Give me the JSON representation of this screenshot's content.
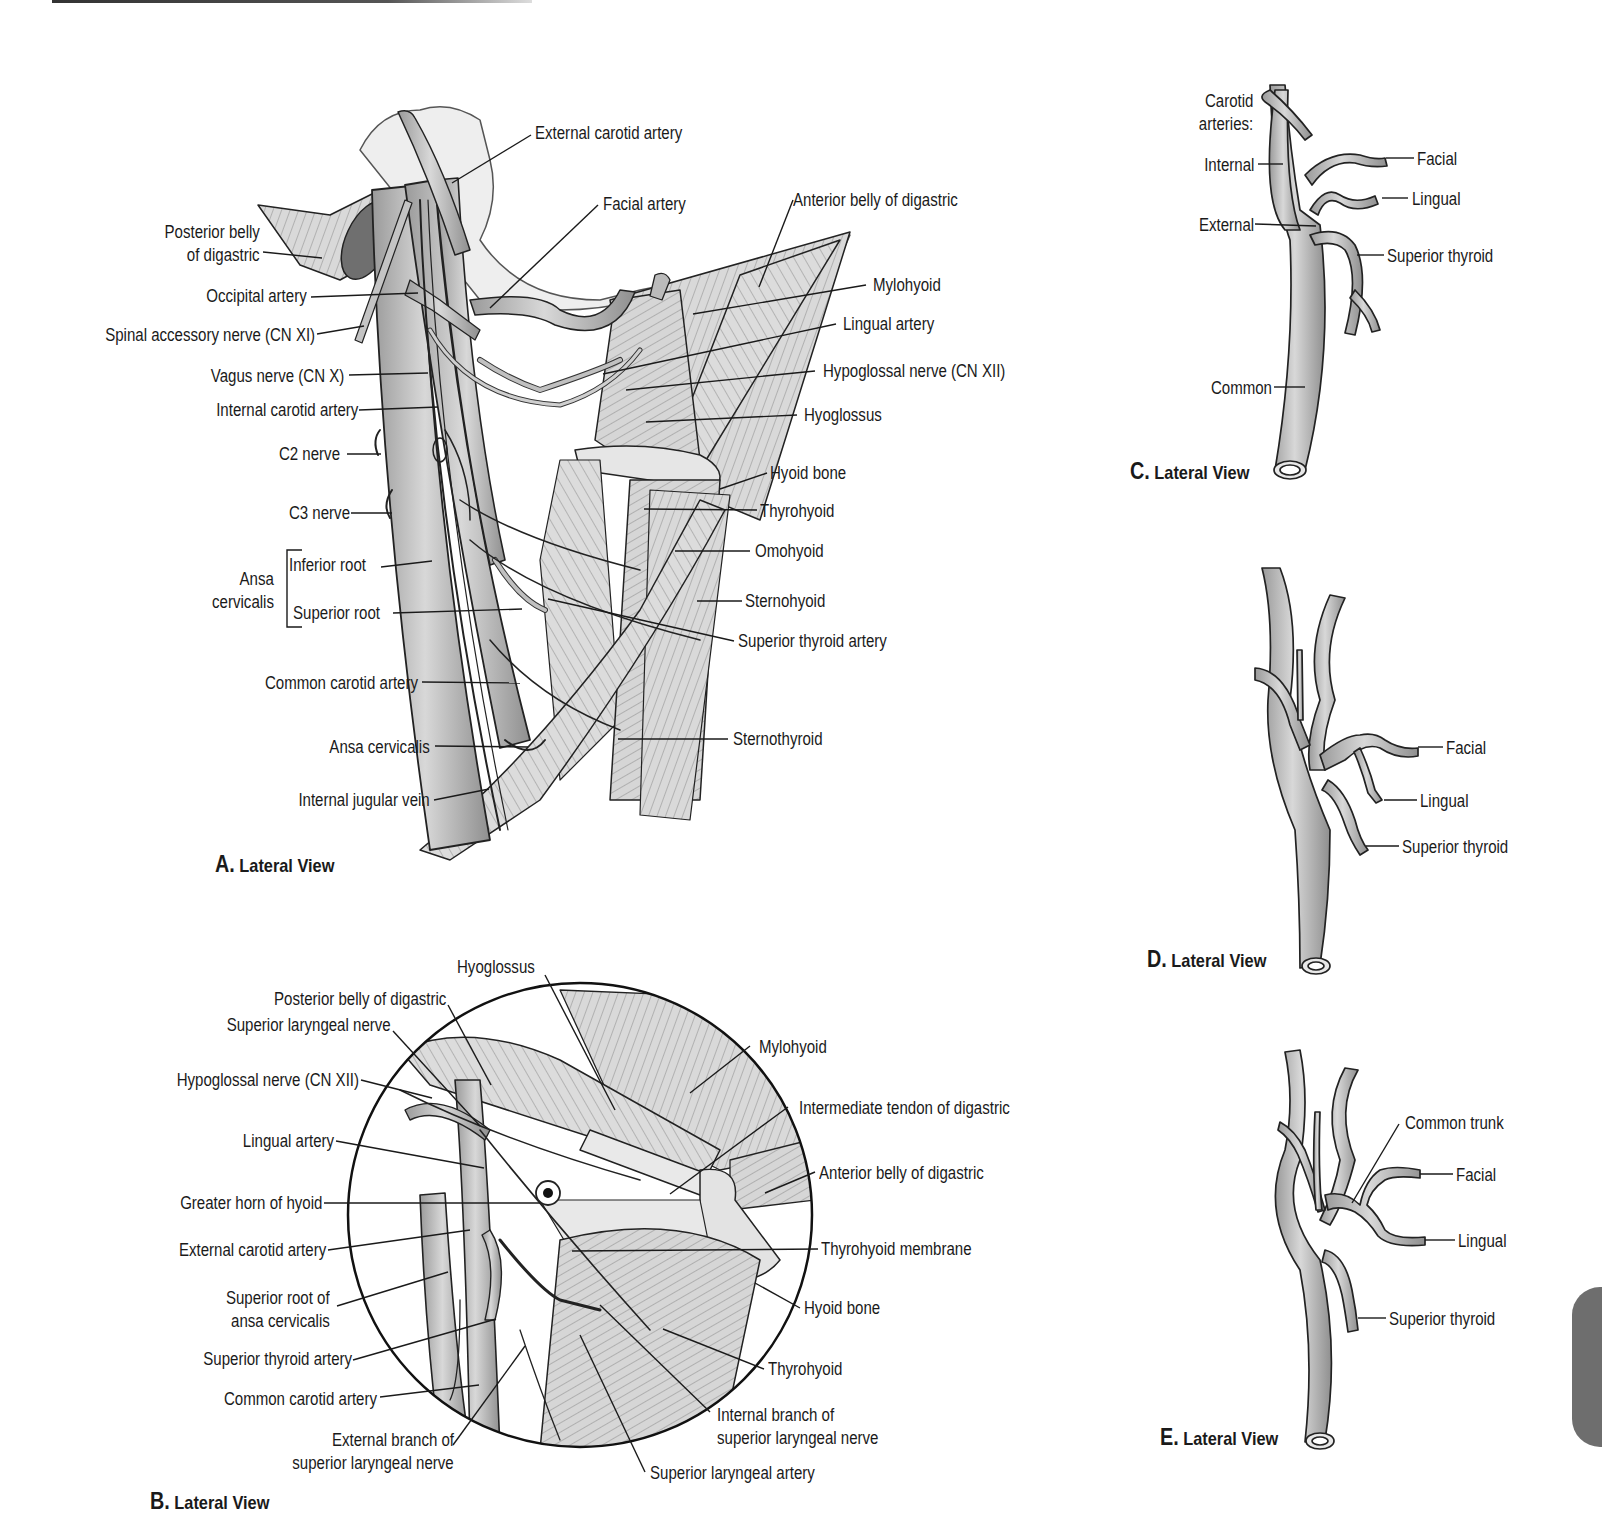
{
  "panels": {
    "A": {
      "caption_letter": "A.",
      "caption_text": "Lateral View",
      "labels": {
        "external_carotid_artery": "External carotid artery",
        "facial_artery": "Facial artery",
        "anterior_belly_of_digastric": "Anterior belly of digastric",
        "posterior_belly_line1": "Posterior belly",
        "posterior_belly_line2": "of digastric",
        "occipital_artery": "Occipital artery",
        "spinal_accessory_nerve": "Spinal accessory nerve (CN XI)",
        "vagus_nerve": "Vagus nerve (CN X)",
        "internal_carotid_artery": "Internal carotid artery",
        "c2_nerve": "C2 nerve",
        "c3_nerve": "C3 nerve",
        "ansa_group_line1": "Ansa",
        "ansa_group_line2": "cervicalis",
        "inferior_root": "Inferior root",
        "superior_root": "Superior root",
        "common_carotid_artery": "Common carotid artery",
        "ansa_cervicalis": "Ansa cervicalis",
        "internal_jugular_vein": "Internal jugular vein",
        "mylohyoid": "Mylohyoid",
        "lingual_artery": "Lingual artery",
        "hypoglossal_nerve": "Hypoglossal nerve (CN XII)",
        "hyoglossus": "Hyoglossus",
        "hyoid_bone": "Hyoid bone",
        "thyrohyoid": "Thyrohyoid",
        "omohyoid": "Omohyoid",
        "sternohyoid": "Sternohyoid",
        "superior_thyroid_artery": "Superior thyroid artery",
        "sternothyroid": "Sternothyroid"
      }
    },
    "B": {
      "caption_letter": "B.",
      "caption_text": "Lateral View",
      "labels": {
        "hyoglossus": "Hyoglossus",
        "posterior_belly_of_digastric": "Posterior belly of digastric",
        "superior_laryngeal_nerve": "Superior laryngeal nerve",
        "hypoglossal_nerve": "Hypoglossal nerve (CN XII)",
        "lingual_artery": "Lingual artery",
        "greater_horn_of_hyoid": "Greater horn of hyoid",
        "external_carotid_artery": "External carotid artery",
        "superior_root_line1": "Superior root of",
        "superior_root_line2": "ansa cervicalis",
        "superior_thyroid_artery": "Superior thyroid artery",
        "common_carotid_artery": "Common carotid artery",
        "external_branch_line1": "External branch of",
        "external_branch_line2": "superior laryngeal nerve",
        "mylohyoid": "Mylohyoid",
        "intermediate_tendon": "Intermediate tendon of digastric",
        "anterior_belly_of_digastric": "Anterior belly of digastric",
        "thyrohyoid_membrane": "Thyrohyoid membrane",
        "hyoid_bone": "Hyoid bone",
        "thyrohyoid": "Thyrohyoid",
        "internal_branch_line1": "Internal branch of",
        "internal_branch_line2": "superior laryngeal nerve",
        "superior_laryngeal_artery": "Superior laryngeal artery"
      }
    },
    "C": {
      "caption_letter": "C.",
      "caption_text": "Lateral View",
      "labels": {
        "carotid_line1": "Carotid",
        "carotid_line2": "arteries:",
        "internal": "Internal",
        "external": "External",
        "common": "Common",
        "facial": "Facial",
        "lingual": "Lingual",
        "superior_thyroid": "Superior thyroid"
      }
    },
    "D": {
      "caption_letter": "D.",
      "caption_text": "Lateral View",
      "labels": {
        "facial": "Facial",
        "lingual": "Lingual",
        "superior_thyroid": "Superior thyroid"
      }
    },
    "E": {
      "caption_letter": "E.",
      "caption_text": "Lateral View",
      "labels": {
        "common_trunk": "Common trunk",
        "facial": "Facial",
        "lingual": "Lingual",
        "superior_thyroid": "Superior thyroid"
      }
    }
  },
  "colors": {
    "vessel_fill": "#b9b9b9",
    "vessel_outline": "#2a2a2a",
    "muscle_fill": "#d4d4d4",
    "thumb_tab": "#6e6e6e"
  }
}
